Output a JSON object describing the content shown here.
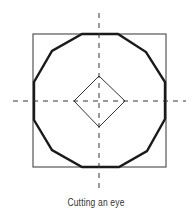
{
  "figure": {
    "caption": "Cutting an eye",
    "colors": {
      "background": "#ffffff",
      "stroke": "#1a1a1a",
      "square_stroke": "#555555",
      "axis_stroke": "#333333"
    },
    "elements": {
      "outer_square": {
        "x": 33,
        "y": 34,
        "width": 133,
        "height": 133
      },
      "dodecagon_points": "82,34 118,34 146,52 165,82 165,119 147,151 119,167 82,167 52,150 34,120 34,82 52,51",
      "inner_diamond_points": "99,76 125,101 99,127 74,101",
      "vertical_axis": {
        "x": 99,
        "y1": 13,
        "y2": 190
      },
      "horizontal_axis": {
        "y": 101,
        "x1": 13,
        "x2": 186
      }
    }
  }
}
